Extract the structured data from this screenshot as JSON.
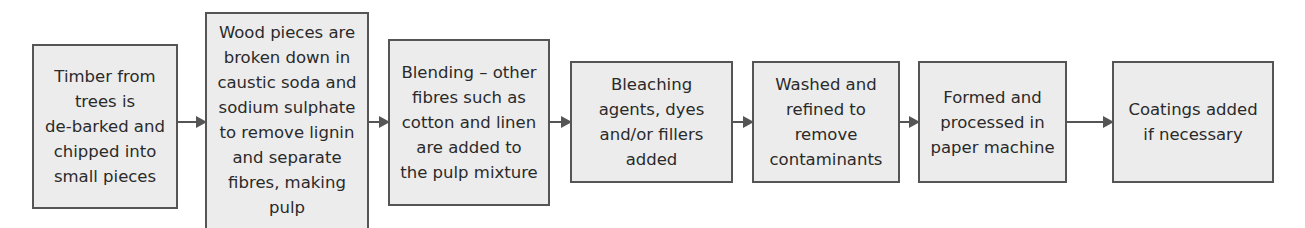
{
  "diagram": {
    "type": "flowchart",
    "direction": "left-to-right",
    "steps": [
      {
        "id": 1,
        "lines": [
          "Timber from",
          "trees is",
          "de-barked and",
          "chipped into",
          "small pieces"
        ]
      },
      {
        "id": 2,
        "lines": [
          "Wood pieces are",
          "broken down in",
          "caustic soda and",
          "sodium sulphate",
          "to remove lignin",
          "and separate",
          "fibres, making",
          "pulp"
        ]
      },
      {
        "id": 3,
        "lines": [
          "Blending – other",
          "fibres such as",
          "cotton and linen",
          "are added to",
          "the pulp mixture"
        ]
      },
      {
        "id": 4,
        "lines": [
          "Bleaching",
          "agents, dyes",
          "and/or fillers",
          "added"
        ]
      },
      {
        "id": 5,
        "lines": [
          "Washed and",
          "refined to",
          "remove",
          "contaminants"
        ]
      },
      {
        "id": 6,
        "lines": [
          "Formed and",
          "processed in",
          "paper machine"
        ]
      },
      {
        "id": 7,
        "lines": [
          "Coatings added",
          "if necessary"
        ]
      }
    ],
    "connectors": [
      {
        "from": 1,
        "to": 2
      },
      {
        "from": 2,
        "to": 3
      },
      {
        "from": 3,
        "to": 4
      },
      {
        "from": 4,
        "to": 5
      },
      {
        "from": 5,
        "to": 6
      },
      {
        "from": 6,
        "to": 7
      }
    ],
    "colors": {
      "box_fill": "#ececec",
      "box_border": "#555555",
      "text": "#2a2a2a",
      "arrow": "#555555"
    }
  }
}
